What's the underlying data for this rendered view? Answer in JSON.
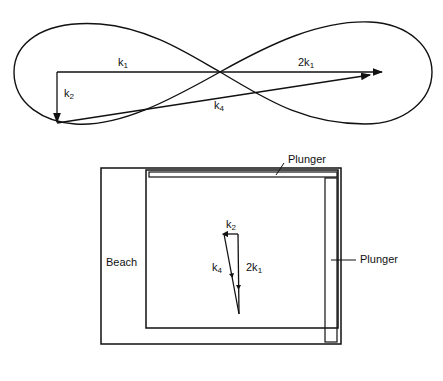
{
  "top_diagram": {
    "labels": {
      "k1": {
        "base": "k",
        "sub": "1"
      },
      "two_k1": {
        "base": "2k",
        "sub": "1"
      },
      "k2": {
        "base": "k",
        "sub": "2"
      },
      "k4": {
        "base": "k",
        "sub": "4"
      }
    }
  },
  "basin_diagram": {
    "labels": {
      "plunger_top": "Plunger",
      "plunger_right": "Plunger",
      "beach": "Beach",
      "k2": {
        "base": "k",
        "sub": "2"
      },
      "k4": {
        "base": "k",
        "sub": "4"
      },
      "two_k1": {
        "base": "2k",
        "sub": "1"
      }
    }
  },
  "colors": {
    "line": "#111111",
    "background": "#ffffff"
  }
}
